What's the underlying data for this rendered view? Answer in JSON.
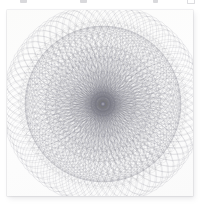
{
  "canvas": {
    "width": 206,
    "height": 206,
    "page_background": "#ffffff"
  },
  "clipped_row": {
    "description": "faint cut-off marks along the very top edge",
    "marks": [
      {
        "name": "clipped-mark-1",
        "x": 20,
        "width": 7,
        "style": "solid"
      },
      {
        "name": "clipped-mark-2",
        "x": 80,
        "width": 7,
        "style": "solid"
      },
      {
        "name": "clipped-mark-3",
        "x": 153,
        "width": 5,
        "style": "solid"
      },
      {
        "name": "clipped-mark-4",
        "x": 187,
        "width": 6,
        "style": "hollow"
      }
    ]
  },
  "card": {
    "name": "artwork-card",
    "x": 7,
    "y": 10,
    "width": 186,
    "height": 186,
    "background": "#fdfdfc",
    "shadow_color": "#8a8a94",
    "caption": "Spirograph rosette"
  },
  "artwork": {
    "type": "spirograph",
    "title": "Spirograph rosette",
    "line_color": "#6f6f7d",
    "line_color_light": "#9a9aa6",
    "line_width": 0.38,
    "opacity": 0.5,
    "center_x": 96,
    "center_y": 94,
    "outer_radius": 78,
    "layers": [
      {
        "name": "outer-petal-ring",
        "count": 36,
        "orbit_radius": 40,
        "circle_radius": 38,
        "phase": 0,
        "opacity": 0.42,
        "stroke": "#6f6f7d"
      },
      {
        "name": "outer-petal-ring-offset",
        "count": 36,
        "orbit_radius": 40,
        "circle_radius": 38,
        "phase": 5,
        "opacity": 0.36,
        "stroke": "#7b7b88"
      },
      {
        "name": "mid-petal-ring",
        "count": 30,
        "orbit_radius": 28,
        "circle_radius": 30,
        "phase": 3,
        "opacity": 0.34,
        "stroke": "#76767f"
      },
      {
        "name": "mid-petal-ring-b",
        "count": 24,
        "orbit_radius": 22,
        "circle_radius": 26,
        "phase": 7.5,
        "opacity": 0.32,
        "stroke": "#7e7e8a"
      },
      {
        "name": "inner-petal-ring",
        "count": 20,
        "orbit_radius": 14,
        "circle_radius": 19,
        "phase": 9,
        "opacity": 0.3,
        "stroke": "#83838e"
      },
      {
        "name": "core-ring",
        "count": 16,
        "orbit_radius": 7,
        "circle_radius": 11,
        "phase": 11,
        "opacity": 0.3,
        "stroke": "#8a8a94"
      }
    ],
    "hypotrochoid": {
      "name": "hypotrochoid-curves",
      "passes": [
        {
          "R": 74,
          "r": 23,
          "d": 50,
          "turns": 23,
          "opacity": 0.3,
          "stroke": "#6c6c7a",
          "rotate": 0
        },
        {
          "R": 72,
          "r": 19,
          "d": 46,
          "turns": 19,
          "opacity": 0.26,
          "stroke": "#71717f",
          "rotate": 9
        },
        {
          "R": 70,
          "r": 29,
          "d": 44,
          "turns": 29,
          "opacity": 0.24,
          "stroke": "#76767f",
          "rotate": 17
        },
        {
          "R": 62,
          "r": 17,
          "d": 38,
          "turns": 17,
          "opacity": 0.24,
          "stroke": "#7a7a86",
          "rotate": 5
        },
        {
          "R": 54,
          "r": 13,
          "d": 30,
          "turns": 13,
          "opacity": 0.22,
          "stroke": "#7f7f8a",
          "rotate": 13
        },
        {
          "R": 40,
          "r": 11,
          "d": 22,
          "turns": 11,
          "opacity": 0.22,
          "stroke": "#84848e",
          "rotate": 21
        }
      ]
    },
    "core_bullseye": {
      "name": "core-bullseye",
      "radii": [
        3.2,
        5.2,
        7.4,
        9.6,
        12.0
      ],
      "stroke": "#7c7c88",
      "opacity": 0.55,
      "center_dot_radius": 2.0,
      "center_dot_fill": "#9b9ba6"
    }
  }
}
